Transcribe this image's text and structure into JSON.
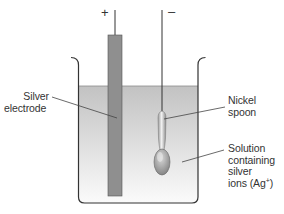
{
  "diagram": {
    "terminals": {
      "positive": "+",
      "negative": "–"
    },
    "labels": {
      "silver_electrode": [
        "Silver",
        "electrode"
      ],
      "nickel_spoon": [
        "Nickel",
        "spoon"
      ],
      "solution": [
        "Solution",
        "containing",
        "silver",
        "ions (Ag",
        "+",
        ")"
      ]
    },
    "colors": {
      "electrode": "#8f8f8f",
      "solution_top": "#c4c4c4",
      "solution_bottom": "#fafafa",
      "outline": "#333333",
      "label_text": "#333333"
    }
  }
}
